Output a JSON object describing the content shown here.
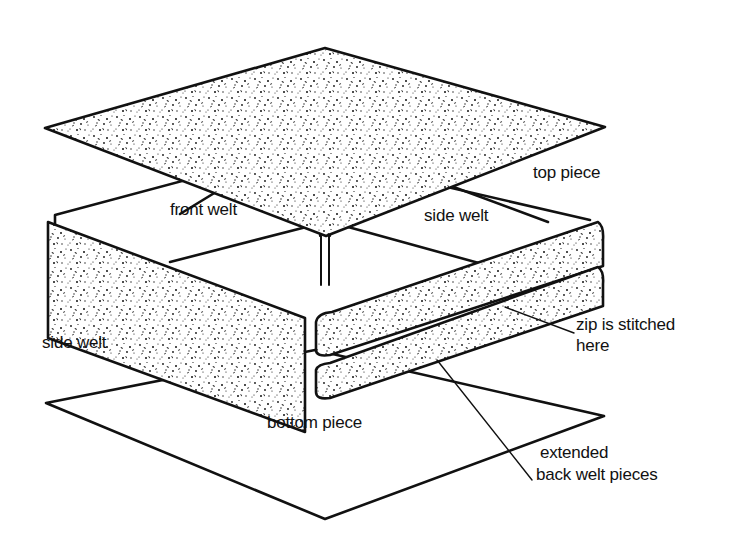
{
  "figure": {
    "type": "exploded cushion cover assembly diagram",
    "labels": {
      "top_piece": "top piece",
      "front_welt": "front welt",
      "side_welt_right": "side welt",
      "side_welt_left": "side welt",
      "zip_line1": "zip is stitched",
      "zip_line2": "here",
      "bottom_piece": "bottom piece",
      "extended_line1": "extended",
      "extended_line2": "back welt pieces"
    },
    "colors": {
      "ink": "#111111",
      "paper": "#ffffff"
    }
  }
}
